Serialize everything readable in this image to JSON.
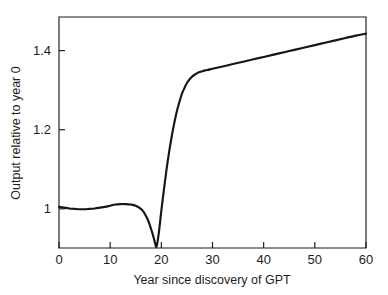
{
  "chart_data": {
    "type": "line",
    "title": "",
    "xlabel": "Year since discovery of GPT",
    "ylabel": "Output relative to year 0",
    "xlim": [
      0,
      60
    ],
    "ylim": [
      0.901,
      1.485
    ],
    "grid": false,
    "legend": null,
    "xticks": [
      0,
      10,
      20,
      30,
      40,
      50,
      60
    ],
    "xticklabels": [
      "0",
      "10",
      "20",
      "30",
      "40",
      "50",
      "60"
    ],
    "yticks": [
      1,
      1.2,
      1.4
    ],
    "yticklabels": [
      "1",
      "1.2",
      "1.4"
    ],
    "series": [
      {
        "name": "Output relative to year 0",
        "color": "#161616",
        "x": [
          0,
          1,
          2,
          3,
          4,
          5,
          6,
          7,
          8,
          9,
          10,
          11,
          12,
          13,
          14,
          15,
          16,
          16.5,
          17,
          17.5,
          18,
          18.4,
          18.8,
          19,
          19.2,
          19.6,
          20,
          20.5,
          21,
          21.5,
          22,
          22.5,
          23,
          23.5,
          24,
          24.5,
          25,
          25.5,
          26,
          26.5,
          27,
          27.5,
          28,
          28.5,
          29,
          30,
          32,
          34,
          36,
          38,
          40,
          42,
          44,
          46,
          48,
          50,
          52,
          54,
          56,
          58,
          60
        ],
        "y": [
          1.005,
          1.003,
          1.001,
          1.0,
          0.999,
          0.999,
          1.0,
          1.001,
          1.003,
          1.005,
          1.008,
          1.011,
          1.012,
          1.012,
          1.011,
          1.008,
          1.0,
          0.993,
          0.982,
          0.968,
          0.949,
          0.932,
          0.912,
          0.903,
          0.912,
          0.949,
          0.995,
          1.048,
          1.098,
          1.142,
          1.181,
          1.215,
          1.245,
          1.269,
          1.29,
          1.305,
          1.318,
          1.327,
          1.334,
          1.339,
          1.343,
          1.346,
          1.348,
          1.35,
          1.351,
          1.354,
          1.36,
          1.366,
          1.372,
          1.378,
          1.384,
          1.39,
          1.396,
          1.402,
          1.408,
          1.414,
          1.42,
          1.426,
          1.432,
          1.438,
          1.443
        ]
      }
    ]
  },
  "labels": {
    "xlabel": "Year since discovery of GPT",
    "ylabel": "Output relative to year 0"
  }
}
